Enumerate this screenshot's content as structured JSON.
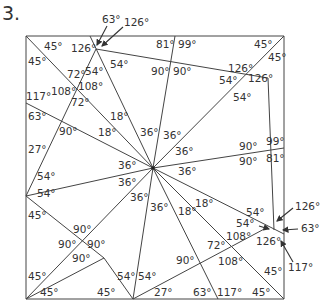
{
  "problem_number": "3.",
  "square": {
    "left": 26,
    "top": 36,
    "right": 284,
    "bottom": 299
  },
  "center": {
    "x": 153,
    "y": 168
  },
  "lines": [
    {
      "x1": 26,
      "y1": 36,
      "x2": 284,
      "y2": 36
    },
    {
      "x1": 284,
      "y1": 36,
      "x2": 284,
      "y2": 299
    },
    {
      "x1": 284,
      "y1": 299,
      "x2": 26,
      "y2": 299
    },
    {
      "x1": 26,
      "y1": 299,
      "x2": 26,
      "y2": 36
    },
    {
      "x1": 26,
      "y1": 36,
      "x2": 153,
      "y2": 168
    },
    {
      "x1": 90,
      "y1": 36,
      "x2": 153,
      "y2": 168
    },
    {
      "x1": 96,
      "y1": 49,
      "x2": 26,
      "y2": 196
    },
    {
      "x1": 96,
      "y1": 49,
      "x2": 268,
      "y2": 78
    },
    {
      "x1": 175,
      "y1": 36,
      "x2": 153,
      "y2": 168
    },
    {
      "x1": 284,
      "y1": 36,
      "x2": 153,
      "y2": 168
    },
    {
      "x1": 26,
      "y1": 103,
      "x2": 153,
      "y2": 168
    },
    {
      "x1": 26,
      "y1": 196,
      "x2": 153,
      "y2": 168
    },
    {
      "x1": 284,
      "y1": 148,
      "x2": 153,
      "y2": 168
    },
    {
      "x1": 268,
      "y1": 78,
      "x2": 274,
      "y2": 230
    },
    {
      "x1": 26,
      "y1": 299,
      "x2": 153,
      "y2": 168
    },
    {
      "x1": 133,
      "y1": 299,
      "x2": 153,
      "y2": 168
    },
    {
      "x1": 218,
      "y1": 299,
      "x2": 153,
      "y2": 168
    },
    {
      "x1": 284,
      "y1": 299,
      "x2": 153,
      "y2": 168
    },
    {
      "x1": 284,
      "y1": 234,
      "x2": 153,
      "y2": 168
    },
    {
      "x1": 26,
      "y1": 196,
      "x2": 104,
      "y2": 258
    },
    {
      "x1": 26,
      "y1": 299,
      "x2": 104,
      "y2": 258
    },
    {
      "x1": 104,
      "y1": 258,
      "x2": 133,
      "y2": 299
    },
    {
      "x1": 133,
      "y1": 299,
      "x2": 268,
      "y2": 227
    }
  ],
  "angle_labels": [
    {
      "text": "63°",
      "x": 102,
      "y": 23
    },
    {
      "text": "126°",
      "x": 124,
      "y": 26
    },
    {
      "text": "45°",
      "x": 44,
      "y": 50
    },
    {
      "text": "126°",
      "x": 71,
      "y": 52
    },
    {
      "text": "81°",
      "x": 156,
      "y": 48
    },
    {
      "text": "99°",
      "x": 178,
      "y": 48
    },
    {
      "text": "45°",
      "x": 254,
      "y": 48
    },
    {
      "text": "45°",
      "x": 28,
      "y": 65
    },
    {
      "text": "54°",
      "x": 85,
      "y": 75
    },
    {
      "text": "54°",
      "x": 110,
      "y": 68
    },
    {
      "text": "90°",
      "x": 151,
      "y": 75
    },
    {
      "text": "90°",
      "x": 173,
      "y": 75
    },
    {
      "text": "126°",
      "x": 228,
      "y": 72
    },
    {
      "text": "45°",
      "x": 268,
      "y": 61
    },
    {
      "text": "72°",
      "x": 67,
      "y": 78
    },
    {
      "text": "54°",
      "x": 219,
      "y": 84
    },
    {
      "text": "126°",
      "x": 248,
      "y": 82
    },
    {
      "text": "108°",
      "x": 78,
      "y": 90
    },
    {
      "text": "108°",
      "x": 51,
      "y": 95
    },
    {
      "text": "117°",
      "x": 26,
      "y": 100
    },
    {
      "text": "72°",
      "x": 71,
      "y": 106
    },
    {
      "text": "54°",
      "x": 233,
      "y": 101
    },
    {
      "text": "63°",
      "x": 28,
      "y": 120
    },
    {
      "text": "18°",
      "x": 110,
      "y": 120
    },
    {
      "text": "90°",
      "x": 59,
      "y": 135
    },
    {
      "text": "18°",
      "x": 98,
      "y": 136
    },
    {
      "text": "36°",
      "x": 140,
      "y": 136
    },
    {
      "text": "36°",
      "x": 163,
      "y": 139
    },
    {
      "text": "36°",
      "x": 175,
      "y": 155
    },
    {
      "text": "90°",
      "x": 239,
      "y": 150
    },
    {
      "text": "99°",
      "x": 266,
      "y": 145
    },
    {
      "text": "27°",
      "x": 28,
      "y": 153
    },
    {
      "text": "36°",
      "x": 118,
      "y": 169
    },
    {
      "text": "36°",
      "x": 178,
      "y": 175
    },
    {
      "text": "90°",
      "x": 239,
      "y": 165
    },
    {
      "text": "81°",
      "x": 266,
      "y": 162
    },
    {
      "text": "54°",
      "x": 37,
      "y": 180
    },
    {
      "text": "54°",
      "x": 37,
      "y": 197
    },
    {
      "text": "36°",
      "x": 118,
      "y": 186
    },
    {
      "text": "36°",
      "x": 130,
      "y": 201
    },
    {
      "text": "18°",
      "x": 195,
      "y": 207
    },
    {
      "text": "18°",
      "x": 178,
      "y": 215
    },
    {
      "text": "36°",
      "x": 150,
      "y": 211
    },
    {
      "text": "45°",
      "x": 28,
      "y": 219
    },
    {
      "text": "54°",
      "x": 246,
      "y": 216
    },
    {
      "text": "126°",
      "x": 295,
      "y": 210
    },
    {
      "text": "54°",
      "x": 236,
      "y": 227
    },
    {
      "text": "63°",
      "x": 301,
      "y": 232
    },
    {
      "text": "108°",
      "x": 226,
      "y": 240
    },
    {
      "text": "126°",
      "x": 256,
      "y": 245
    },
    {
      "text": "90°",
      "x": 73,
      "y": 233
    },
    {
      "text": "90°",
      "x": 58,
      "y": 248
    },
    {
      "text": "90°",
      "x": 87,
      "y": 248
    },
    {
      "text": "72°",
      "x": 207,
      "y": 249
    },
    {
      "text": "117°",
      "x": 288,
      "y": 271
    },
    {
      "text": "90°",
      "x": 72,
      "y": 262
    },
    {
      "text": "90°",
      "x": 176,
      "y": 264
    },
    {
      "text": "108°",
      "x": 218,
      "y": 265
    },
    {
      "text": "45°",
      "x": 264,
      "y": 275
    },
    {
      "text": "45°",
      "x": 28,
      "y": 280
    },
    {
      "text": "54°",
      "x": 117,
      "y": 280
    },
    {
      "text": "54°",
      "x": 138,
      "y": 280
    },
    {
      "text": "45°",
      "x": 40,
      "y": 296
    },
    {
      "text": "45°",
      "x": 97,
      "y": 296
    },
    {
      "text": "27°",
      "x": 154,
      "y": 296
    },
    {
      "text": "63°",
      "x": 193,
      "y": 296
    },
    {
      "text": "117°",
      "x": 217,
      "y": 296
    },
    {
      "text": "45°",
      "x": 252,
      "y": 296
    }
  ],
  "arrows": [
    {
      "label_ref": "63°-top",
      "x1": 107,
      "y1": 26,
      "x2": 97,
      "y2": 45
    },
    {
      "label_ref": "126°-top",
      "x1": 123,
      "y1": 27,
      "x2": 102,
      "y2": 46
    },
    {
      "label_ref": "126°-right",
      "x1": 293,
      "y1": 208,
      "x2": 277,
      "y2": 221
    },
    {
      "label_ref": "54°-right",
      "x1": 259,
      "y1": 226,
      "x2": 269,
      "y2": 229
    },
    {
      "label_ref": "63°-right",
      "x1": 298,
      "y1": 229,
      "x2": 283,
      "y2": 230
    },
    {
      "label_ref": "117°-right",
      "x1": 293,
      "y1": 262,
      "x2": 281,
      "y2": 241
    }
  ]
}
